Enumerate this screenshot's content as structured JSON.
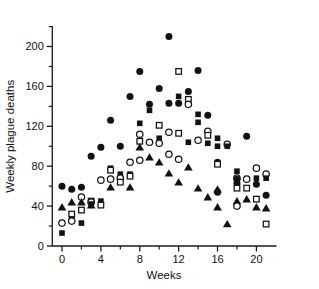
{
  "chart_data": {
    "type": "scatter",
    "title": "",
    "xlabel": "Weeks",
    "ylabel": "Weekly plague deaths",
    "xlim": [
      -1,
      22
    ],
    "ylim": [
      0,
      220
    ],
    "xticks": [
      0,
      4,
      8,
      12,
      16,
      20
    ],
    "xtick_labels": [
      "0",
      "4",
      "8",
      "12",
      "16",
      "20"
    ],
    "x_minor_step": 2,
    "yticks": [
      0,
      40,
      80,
      120,
      160,
      200
    ],
    "ytick_labels": [
      "0",
      "40",
      "80",
      "120",
      "160",
      "200"
    ],
    "y_minor_step": 20,
    "grid": false,
    "legend": "none",
    "x": [
      0,
      1,
      2,
      3,
      4,
      5,
      6,
      7,
      8,
      9,
      10,
      11,
      12,
      13,
      14,
      15,
      16,
      17,
      18,
      19,
      20,
      21
    ],
    "series": [
      {
        "name": "Series A",
        "marker": "filled-circle",
        "color": "#121212",
        "values": [
          60,
          57,
          59,
          90,
          99,
          126,
          100,
          150,
          175,
          142,
          158,
          210,
          143,
          155,
          176,
          131,
          84,
          null,
          63,
          68,
          62,
          51
        ]
      },
      {
        "name": "Series B",
        "marker": "filled-square",
        "color": "#121212",
        "values": [
          13,
          27,
          23,
          42,
          45,
          78,
          72,
          123,
          136,
          108,
          143,
          150,
          104,
          132,
          124,
          108,
          100,
          75,
          67,
          110,
          68,
          null
        ]
      },
      {
        "name": "Series C",
        "marker": "open-circle",
        "color": "#ffffff",
        "values": [
          23,
          49,
          36,
          44,
          66,
          67,
          84,
          86,
          112,
          104,
          92,
          87,
          142,
          106,
          115,
          102,
          68,
          63,
          40,
          78,
          72,
          null
        ]
      },
      {
        "name": "Series D",
        "marker": "open-square",
        "color": "#ffffff",
        "values": [
          null,
          32,
          36,
          45,
          41,
          76,
          64,
          70,
          121,
          114,
          175,
          141,
          126,
          111,
          82,
          68,
          58,
          47,
          22,
          null,
          null,
          null
        ]
      },
      {
        "name": "Series E",
        "marker": "filled-triangle",
        "color": "#121212",
        "values": [
          39,
          44,
          null,
          41,
          51,
          59,
          99,
          89,
          84,
          73,
          64,
          79,
          58,
          49,
          57,
          39,
          22,
          67,
          45,
          39,
          38,
          null
        ]
      }
    ],
    "points": [
      {
        "x": 0,
        "y": 60,
        "m": "filled-circle"
      },
      {
        "x": 0,
        "y": 39,
        "m": "filled-triangle"
      },
      {
        "x": 0,
        "y": 23,
        "m": "open-circle"
      },
      {
        "x": 0,
        "y": 13,
        "m": "filled-square"
      },
      {
        "x": 1,
        "y": 57,
        "m": "filled-circle"
      },
      {
        "x": 1,
        "y": 44,
        "m": "filled-triangle"
      },
      {
        "x": 1,
        "y": 32,
        "m": "open-square"
      },
      {
        "x": 1,
        "y": 27,
        "m": "filled-square"
      },
      {
        "x": 1,
        "y": 25,
        "m": "open-circle"
      },
      {
        "x": 2,
        "y": 59,
        "m": "filled-circle"
      },
      {
        "x": 2,
        "y": 49,
        "m": "open-circle"
      },
      {
        "x": 2,
        "y": 44,
        "m": "filled-triangle"
      },
      {
        "x": 2,
        "y": 36,
        "m": "open-square"
      },
      {
        "x": 2,
        "y": 23,
        "m": "filled-square"
      },
      {
        "x": 3,
        "y": 90,
        "m": "filled-circle"
      },
      {
        "x": 3,
        "y": 45,
        "m": "open-square"
      },
      {
        "x": 3,
        "y": 44,
        "m": "open-circle"
      },
      {
        "x": 3,
        "y": 42,
        "m": "filled-square"
      },
      {
        "x": 3,
        "y": 41,
        "m": "filled-triangle"
      },
      {
        "x": 4,
        "y": 99,
        "m": "filled-circle"
      },
      {
        "x": 4,
        "y": 66,
        "m": "open-circle"
      },
      {
        "x": 4,
        "y": 45,
        "m": "filled-square"
      },
      {
        "x": 4,
        "y": 41,
        "m": "open-square"
      },
      {
        "x": 5,
        "y": 126,
        "m": "filled-circle"
      },
      {
        "x": 5,
        "y": 78,
        "m": "filled-square"
      },
      {
        "x": 5,
        "y": 76,
        "m": "open-square"
      },
      {
        "x": 5,
        "y": 67,
        "m": "open-circle"
      },
      {
        "x": 5,
        "y": 59,
        "m": "filled-triangle"
      },
      {
        "x": 6,
        "y": 100,
        "m": "filled-circle"
      },
      {
        "x": 6,
        "y": 72,
        "m": "filled-square"
      },
      {
        "x": 6,
        "y": 68,
        "m": "open-circle"
      },
      {
        "x": 6,
        "y": 64,
        "m": "open-square"
      },
      {
        "x": 7,
        "y": 150,
        "m": "filled-circle"
      },
      {
        "x": 7,
        "y": 84,
        "m": "open-circle"
      },
      {
        "x": 7,
        "y": 72,
        "m": "filled-square"
      },
      {
        "x": 7,
        "y": 70,
        "m": "open-square"
      },
      {
        "x": 7,
        "y": 59,
        "m": "filled-triangle"
      },
      {
        "x": 8,
        "y": 175,
        "m": "filled-circle"
      },
      {
        "x": 8,
        "y": 123,
        "m": "filled-square"
      },
      {
        "x": 8,
        "y": 112,
        "m": "open-circle"
      },
      {
        "x": 8,
        "y": 105,
        "m": "open-square"
      },
      {
        "x": 8,
        "y": 86,
        "m": "open-circle"
      },
      {
        "x": 8,
        "y": 99,
        "m": "filled-triangle"
      },
      {
        "x": 9,
        "y": 142,
        "m": "filled-circle"
      },
      {
        "x": 9,
        "y": 136,
        "m": "filled-square"
      },
      {
        "x": 9,
        "y": 104,
        "m": "open-circle"
      },
      {
        "x": 9,
        "y": 89,
        "m": "filled-triangle"
      },
      {
        "x": 10,
        "y": 158,
        "m": "filled-circle"
      },
      {
        "x": 10,
        "y": 121,
        "m": "open-square"
      },
      {
        "x": 10,
        "y": 108,
        "m": "filled-square"
      },
      {
        "x": 10,
        "y": 103,
        "m": "open-circle"
      },
      {
        "x": 10,
        "y": 84,
        "m": "filled-triangle"
      },
      {
        "x": 11,
        "y": 210,
        "m": "filled-circle"
      },
      {
        "x": 11,
        "y": 143,
        "m": "filled-circle"
      },
      {
        "x": 11,
        "y": 114,
        "m": "open-circle"
      },
      {
        "x": 11,
        "y": 92,
        "m": "open-circle"
      },
      {
        "x": 11,
        "y": 73,
        "m": "filled-triangle"
      },
      {
        "x": 12,
        "y": 175,
        "m": "open-square"
      },
      {
        "x": 12,
        "y": 150,
        "m": "filled-square"
      },
      {
        "x": 12,
        "y": 143,
        "m": "filled-circle"
      },
      {
        "x": 12,
        "y": 113,
        "m": "open-square"
      },
      {
        "x": 12,
        "y": 87,
        "m": "open-circle"
      },
      {
        "x": 12,
        "y": 64,
        "m": "filled-triangle"
      },
      {
        "x": 13,
        "y": 155,
        "m": "filled-circle"
      },
      {
        "x": 13,
        "y": 147,
        "m": "open-square"
      },
      {
        "x": 13,
        "y": 142,
        "m": "open-circle"
      },
      {
        "x": 13,
        "y": 104,
        "m": "filled-square"
      },
      {
        "x": 13,
        "y": 79,
        "m": "filled-triangle"
      },
      {
        "x": 14,
        "y": 176,
        "m": "filled-circle"
      },
      {
        "x": 14,
        "y": 132,
        "m": "filled-square"
      },
      {
        "x": 14,
        "y": 124,
        "m": "filled-square"
      },
      {
        "x": 14,
        "y": 106,
        "m": "open-circle"
      },
      {
        "x": 14,
        "y": 58,
        "m": "filled-triangle"
      },
      {
        "x": 15,
        "y": 131,
        "m": "filled-circle"
      },
      {
        "x": 15,
        "y": 115,
        "m": "open-circle"
      },
      {
        "x": 15,
        "y": 111,
        "m": "open-square"
      },
      {
        "x": 15,
        "y": 103,
        "m": "filled-square"
      },
      {
        "x": 15,
        "y": 49,
        "m": "filled-triangle"
      },
      {
        "x": 16,
        "y": 108,
        "m": "filled-square"
      },
      {
        "x": 16,
        "y": 100,
        "m": "filled-square"
      },
      {
        "x": 16,
        "y": 84,
        "m": "filled-circle"
      },
      {
        "x": 16,
        "y": 82,
        "m": "open-square"
      },
      {
        "x": 16,
        "y": 57,
        "m": "filled-triangle"
      },
      {
        "x": 16,
        "y": 54,
        "m": "filled-circle"
      },
      {
        "x": 16,
        "y": 39,
        "m": "filled-triangle"
      },
      {
        "x": 17,
        "y": 102,
        "m": "open-circle"
      },
      {
        "x": 17,
        "y": 100,
        "m": "filled-square"
      },
      {
        "x": 17,
        "y": 22,
        "m": "filled-triangle"
      },
      {
        "x": 18,
        "y": 75,
        "m": "filled-square"
      },
      {
        "x": 18,
        "y": 68,
        "m": "open-circle"
      },
      {
        "x": 18,
        "y": 67,
        "m": "filled-circle"
      },
      {
        "x": 18,
        "y": 63,
        "m": "filled-circle"
      },
      {
        "x": 18,
        "y": 58,
        "m": "open-square"
      },
      {
        "x": 18,
        "y": 45,
        "m": "filled-triangle"
      },
      {
        "x": 18,
        "y": 40,
        "m": "open-circle"
      },
      {
        "x": 19,
        "y": 110,
        "m": "filled-circle"
      },
      {
        "x": 19,
        "y": 67,
        "m": "open-circle"
      },
      {
        "x": 19,
        "y": 58,
        "m": "open-square"
      },
      {
        "x": 19,
        "y": 47,
        "m": "filled-triangle"
      },
      {
        "x": 20,
        "y": 78,
        "m": "open-circle"
      },
      {
        "x": 20,
        "y": 68,
        "m": "filled-square"
      },
      {
        "x": 20,
        "y": 62,
        "m": "filled-circle"
      },
      {
        "x": 20,
        "y": 47,
        "m": "open-square"
      },
      {
        "x": 20,
        "y": 39,
        "m": "filled-triangle"
      },
      {
        "x": 21,
        "y": 72,
        "m": "open-circle"
      },
      {
        "x": 21,
        "y": 68,
        "m": "filled-square"
      },
      {
        "x": 21,
        "y": 51,
        "m": "filled-circle"
      },
      {
        "x": 21,
        "y": 38,
        "m": "filled-triangle"
      },
      {
        "x": 21,
        "y": 22,
        "m": "open-square"
      }
    ]
  }
}
